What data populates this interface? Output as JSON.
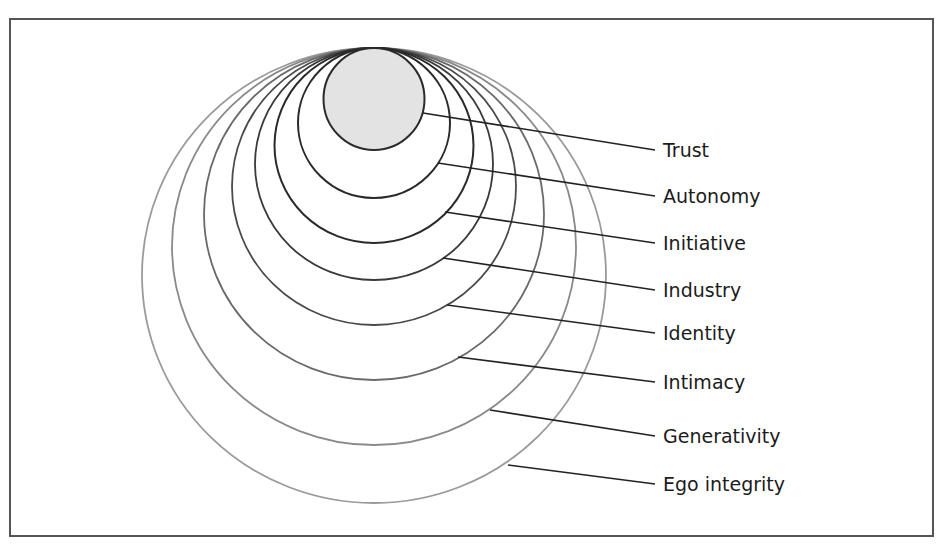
{
  "diagram": {
    "title": "",
    "stages": [
      {
        "name": "Trust",
        "filled": true
      },
      {
        "name": "Autonomy",
        "filled": false
      },
      {
        "name": "Initiative",
        "filled": false
      },
      {
        "name": "Industry",
        "filled": false
      },
      {
        "name": "Identity",
        "filled": false
      },
      {
        "name": "Intimacy",
        "filled": false
      },
      {
        "name": "Generativity",
        "filled": false
      },
      {
        "name": "Ego integrity",
        "filled": false
      }
    ],
    "colors": {
      "fill": "#e3e3e3",
      "inner_stroke": "#2a2a2a",
      "outer_stroke": "#9a9a9a",
      "leader_line": "#222222",
      "text": "#1c1c1c",
      "frame": "#555555"
    }
  }
}
